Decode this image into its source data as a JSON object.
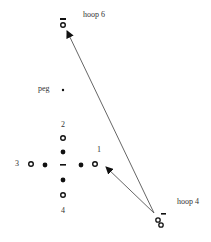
{
  "diagram": {
    "labels": {
      "hoop6": "hoop 6",
      "hoop4": "hoop 4",
      "peg": "peg",
      "n1": "1",
      "n2": "2",
      "n3": "3",
      "n4": "4"
    },
    "colors": {
      "ink": "#111111",
      "arrow": "#555555"
    },
    "arrows": [
      {
        "from": "hoop 4",
        "to": "hoop 6"
      },
      {
        "from": "hoop 4",
        "to": "position 1"
      }
    ]
  }
}
